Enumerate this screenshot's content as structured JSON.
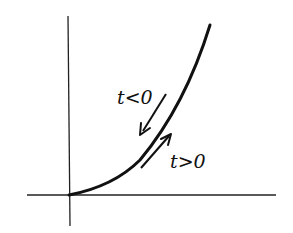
{
  "diagram": {
    "type": "parametric-curve-sketch",
    "axes": {
      "horizontal": true,
      "vertical": true,
      "origin_label": ""
    },
    "labels": {
      "t_negative": "t<0",
      "t_positive": "t>0"
    },
    "arrows": [
      {
        "label": "t<0",
        "direction": "down-left (toward origin)"
      },
      {
        "label": "t>0",
        "direction": "up-right (away from origin)"
      }
    ],
    "colors": {
      "ink": "#111111",
      "background": "#ffffff"
    }
  }
}
